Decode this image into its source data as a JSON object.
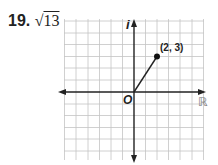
{
  "problem": {
    "number": "19.",
    "answer_radicand": "13",
    "answer_symbol": "√"
  },
  "diagram": {
    "type": "complex-plane",
    "real_axis_label": "ℝ",
    "imag_axis_label": "i",
    "origin_label": "O",
    "point": {
      "x": 2,
      "y": 3,
      "label": "(2, 3)"
    },
    "grid": {
      "x_min": -6,
      "x_max": 6,
      "y_min": -6,
      "y_max": 6
    },
    "colors": {
      "grid": "#bdbdbd",
      "axis": "#222222",
      "point": "#111111"
    }
  }
}
